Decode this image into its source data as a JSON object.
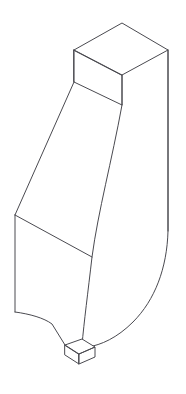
{
  "canvas": {
    "width": 186,
    "height": 394,
    "background_color": "#ffffff",
    "title": "isometric-line-drawing"
  },
  "drawing": {
    "subject": "3d-bracket-solid",
    "view": "isometric",
    "style": "wireframe-outline",
    "line_color": "#4a4a50",
    "line_width": 1,
    "fill_color": "#ffffff",
    "parts": [
      {
        "name": "top-block",
        "description": "rectangular prism head at top with visible top face, left face and right face"
      },
      {
        "name": "tapered-neck",
        "description": "body tapering down-left from the head to the mid-body step"
      },
      {
        "name": "lower-body",
        "description": "vertical slab below the taper with a curved right flank"
      },
      {
        "name": "bottom-tenon",
        "description": "small rectangular tab protruding from the bottom"
      }
    ],
    "paths": {
      "top_face": "M 74 50 L 122 23 L 168 50 L 122 75 Z",
      "head_left_face": "M 74 50 L 122 75 L 122 105 L 74 82 Z",
      "head_right_face": "M 122 75 L 168 50 L 168 231 L 122 105 Z",
      "left_flank_upper": "M 74 82 L 15 215",
      "left_edge_vertical": "M 15 215 L 15 312",
      "mid_step_line": "M 15 215 L 92 257",
      "inner_contour": "M 122 105 C 112 160 98 212 92 257 C 88 292 84 322 82 345",
      "right_outer_contour": "M 168 50 L 168 231 C 167 268 155 300 133 322 C 117 338 101 345 88 347",
      "bottom_left_sweep": "M 15 312 C 30 314 44 318 52 324 L 65 345",
      "tenon_top": "M 65 345 L 82 339 L 95 347 L 79 354 Z",
      "tenon_left": "M 65 345 L 79 354 L 79 364 L 65 355 Z",
      "tenon_right": "M 79 354 L 95 347 L 95 357 L 79 364 Z"
    }
  }
}
